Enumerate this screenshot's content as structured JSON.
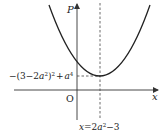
{
  "diagram": {
    "y_axis_label": "P",
    "x_axis_label": "x",
    "origin_label": "O",
    "vertex_value_label": {
      "prefix": "−(3−2",
      "a1": "a",
      "exp1": "2",
      "mid": ")",
      "exp2": "2",
      "plus": "+",
      "a2": "a",
      "exp3": "4"
    },
    "axis_of_symmetry_label": {
      "x": "x",
      "eq": "=2",
      "a": "a",
      "exp": "2",
      "tail": "−3"
    },
    "colors": {
      "curve": "#222222",
      "axes": "#333333",
      "dashed": "#444444"
    }
  }
}
